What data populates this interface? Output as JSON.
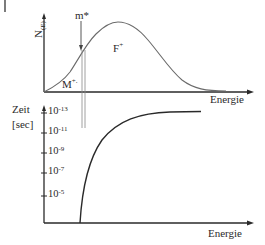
{
  "diagram": {
    "top_chart": {
      "y_axis_label_main": "N",
      "y_axis_label_sub": "(E)",
      "x_axis_label": "Energie",
      "annotations": {
        "m_star": "m*",
        "f_plus": "F",
        "f_plus_sup": "+",
        "m_plus": "M",
        "m_plus_sup": "+."
      }
    },
    "bottom_chart": {
      "y_axis_label_line1": "Zeit",
      "y_axis_label_line2": "[sec]",
      "x_axis_label": "Energie",
      "ticks": [
        {
          "base": "10",
          "exp": "-13"
        },
        {
          "base": "10",
          "exp": "-11"
        },
        {
          "base": "10",
          "exp": "-9"
        },
        {
          "base": "10",
          "exp": "-7"
        },
        {
          "base": "10",
          "exp": "-5"
        }
      ]
    },
    "colors": {
      "line": "#2a2a2a",
      "curve": "#6a6a6a",
      "guide": "#888888"
    }
  }
}
